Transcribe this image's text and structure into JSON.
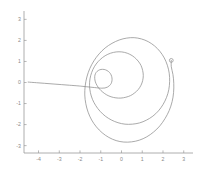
{
  "chart_data": {
    "type": "line",
    "title": "",
    "subtitle": "",
    "xlabel": "",
    "ylabel": "",
    "xlim": [
      -4.7,
      3.35
    ],
    "ylim": [
      -3.35,
      3.35
    ],
    "grid": false,
    "legend": null,
    "series": [
      {
        "name": "spiral",
        "color": "#8d8d8d",
        "marker_at_end": "open-circle",
        "end_point": [
          2.4,
          1.05
        ],
        "start_point": [
          -4.5,
          0.02
        ],
        "description": "inward-then-outward spiral curve",
        "points": [
          [
            -4.5,
            0.02
          ],
          [
            -4.1,
            -0.01
          ],
          [
            -3.7,
            -0.04
          ],
          [
            -3.3,
            -0.07
          ],
          [
            -2.9,
            -0.1
          ],
          [
            -2.5,
            -0.13
          ],
          [
            -2.1,
            -0.16
          ],
          [
            -1.9,
            -0.18
          ],
          [
            -1.7,
            -0.2
          ],
          [
            -1.5,
            -0.22
          ],
          [
            -1.3,
            -0.24
          ],
          [
            -1.1,
            -0.26
          ],
          [
            -0.95,
            -0.27
          ],
          [
            -0.8,
            -0.26
          ],
          [
            -0.68,
            -0.22
          ],
          [
            -0.58,
            -0.15
          ],
          [
            -0.5,
            -0.05
          ],
          [
            -0.46,
            0.08
          ],
          [
            -0.46,
            0.22
          ],
          [
            -0.5,
            0.36
          ],
          [
            -0.58,
            0.48
          ],
          [
            -0.7,
            0.57
          ],
          [
            -0.84,
            0.62
          ],
          [
            -0.99,
            0.62
          ],
          [
            -1.12,
            0.57
          ],
          [
            -1.22,
            0.48
          ],
          [
            -1.28,
            0.35
          ],
          [
            -1.29,
            0.2
          ],
          [
            -1.26,
            0.03
          ],
          [
            -1.18,
            -0.14
          ],
          [
            -1.06,
            -0.31
          ],
          [
            -0.9,
            -0.46
          ],
          [
            -0.71,
            -0.59
          ],
          [
            -0.5,
            -0.68
          ],
          [
            -0.27,
            -0.73
          ],
          [
            -0.03,
            -0.74
          ],
          [
            0.21,
            -0.7
          ],
          [
            0.44,
            -0.62
          ],
          [
            0.64,
            -0.49
          ],
          [
            0.81,
            -0.33
          ],
          [
            0.94,
            -0.13
          ],
          [
            1.02,
            0.09
          ],
          [
            1.05,
            0.33
          ],
          [
            1.02,
            0.57
          ],
          [
            0.94,
            0.81
          ],
          [
            0.8,
            1.02
          ],
          [
            0.62,
            1.2
          ],
          [
            0.4,
            1.34
          ],
          [
            0.15,
            1.43
          ],
          [
            -0.12,
            1.46
          ],
          [
            -0.39,
            1.43
          ],
          [
            -0.66,
            1.34
          ],
          [
            -0.91,
            1.19
          ],
          [
            -1.13,
            0.99
          ],
          [
            -1.31,
            0.75
          ],
          [
            -1.44,
            0.47
          ],
          [
            -1.52,
            0.17
          ],
          [
            -1.54,
            -0.15
          ],
          [
            -1.5,
            -0.48
          ],
          [
            -1.4,
            -0.8
          ],
          [
            -1.24,
            -1.1
          ],
          [
            -1.03,
            -1.37
          ],
          [
            -0.78,
            -1.6
          ],
          [
            -0.49,
            -1.78
          ],
          [
            -0.17,
            -1.91
          ],
          [
            0.17,
            -1.98
          ],
          [
            0.52,
            -1.98
          ],
          [
            0.87,
            -1.92
          ],
          [
            1.2,
            -1.79
          ],
          [
            1.51,
            -1.6
          ],
          [
            1.78,
            -1.35
          ],
          [
            2.0,
            -1.05
          ],
          [
            2.17,
            -0.71
          ],
          [
            2.28,
            -0.34
          ],
          [
            2.32,
            0.05
          ],
          [
            2.3,
            0.44
          ],
          [
            2.21,
            0.82
          ],
          [
            2.06,
            1.17
          ],
          [
            1.85,
            1.48
          ],
          [
            1.59,
            1.74
          ],
          [
            1.29,
            1.94
          ],
          [
            0.96,
            2.07
          ],
          [
            0.61,
            2.13
          ],
          [
            0.25,
            2.11
          ],
          [
            -0.11,
            2.02
          ],
          [
            -0.46,
            1.86
          ],
          [
            -0.79,
            1.64
          ],
          [
            -1.08,
            1.36
          ],
          [
            -1.33,
            1.03
          ],
          [
            -1.53,
            0.66
          ],
          [
            -1.67,
            0.26
          ],
          [
            -1.75,
            -0.16
          ],
          [
            -1.77,
            -0.59
          ],
          [
            -1.72,
            -1.01
          ],
          [
            -1.61,
            -1.41
          ],
          [
            -1.44,
            -1.78
          ],
          [
            -1.21,
            -2.11
          ],
          [
            -0.93,
            -2.39
          ],
          [
            -0.61,
            -2.61
          ],
          [
            -0.26,
            -2.76
          ],
          [
            0.11,
            -2.83
          ],
          [
            0.49,
            -2.82
          ],
          [
            0.86,
            -2.74
          ],
          [
            1.22,
            -2.58
          ],
          [
            1.55,
            -2.35
          ],
          [
            1.85,
            -2.06
          ],
          [
            2.1,
            -1.71
          ],
          [
            2.3,
            -1.33
          ],
          [
            2.44,
            -0.91
          ],
          [
            2.51,
            -0.48
          ],
          [
            2.52,
            -0.04
          ],
          [
            2.48,
            0.38
          ],
          [
            2.4,
            0.75
          ],
          [
            2.4,
            1.05
          ]
        ]
      }
    ],
    "x_ticks": [
      {
        "value": -4,
        "label": "-4"
      },
      {
        "value": -3,
        "label": "-3"
      },
      {
        "value": -2,
        "label": "-2"
      },
      {
        "value": -1,
        "label": "-1"
      },
      {
        "value": 0,
        "label": "0"
      },
      {
        "value": 1,
        "label": "1"
      },
      {
        "value": 2,
        "label": "2"
      },
      {
        "value": 3,
        "label": "3"
      }
    ],
    "y_ticks": [
      {
        "value": 3,
        "label": "3"
      },
      {
        "value": 2,
        "label": "2"
      },
      {
        "value": 1,
        "label": "1"
      },
      {
        "value": 0,
        "label": "0"
      },
      {
        "value": -1,
        "label": "-1"
      },
      {
        "value": -2,
        "label": "-2"
      },
      {
        "value": -3,
        "label": "-3"
      }
    ],
    "colors": {
      "background": "#ffffff",
      "axis": "#9a9a9a",
      "tick_label": "#8a8a8a",
      "curve": "#8d8d8d"
    }
  }
}
